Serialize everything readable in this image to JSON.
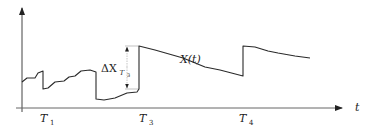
{
  "diagram": {
    "type": "stochastic-process-jump-diagram",
    "colors": {
      "line": "#2a2a2a",
      "axis": "#555555",
      "guide": "#888888",
      "background": "#ffffff"
    },
    "axes": {
      "x_label": "t",
      "y_label": ""
    },
    "curve_label": "X(t)",
    "jump_label": {
      "main": "ΔX",
      "sub_base": "T",
      "sub_index": "3"
    },
    "ticks": [
      {
        "base": "T",
        "index": "1"
      },
      {
        "base": "T",
        "index": "3"
      },
      {
        "base": "T",
        "index": "4"
      }
    ],
    "path_points": [
      [
        22,
        82
      ],
      [
        27,
        78
      ],
      [
        35,
        78
      ],
      [
        38,
        73
      ],
      [
        43,
        71
      ],
      [
        43,
        89
      ],
      [
        48,
        88
      ],
      [
        55,
        82
      ],
      [
        64,
        81
      ],
      [
        69,
        77
      ],
      [
        75,
        76
      ],
      [
        81,
        71
      ],
      [
        90,
        70
      ],
      [
        96,
        72
      ],
      [
        96,
        99
      ],
      [
        104,
        100
      ],
      [
        115,
        98
      ],
      [
        127,
        93
      ],
      [
        137,
        92
      ],
      [
        139,
        89
      ],
      [
        139,
        46
      ],
      [
        155,
        50
      ],
      [
        183,
        58
      ],
      [
        205,
        67
      ],
      [
        220,
        70
      ],
      [
        243,
        76
      ],
      [
        243,
        46
      ],
      [
        255,
        47
      ],
      [
        268,
        51
      ],
      [
        278,
        53
      ],
      [
        295,
        56
      ],
      [
        310,
        58
      ]
    ]
  }
}
